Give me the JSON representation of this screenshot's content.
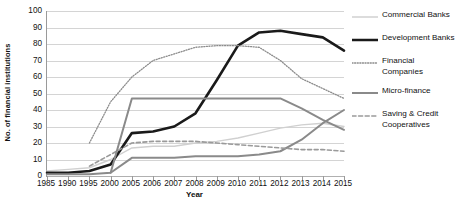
{
  "chart_data": {
    "type": "line",
    "title": "",
    "xlabel": "Year",
    "ylabel": "No. of financial institutions",
    "categories": [
      "1985",
      "1990",
      "1995",
      "2000",
      "2005",
      "2006",
      "2007",
      "2008",
      "2009",
      "2010",
      "2011",
      "2012",
      "2013",
      "2014",
      "2015"
    ],
    "ylim": [
      0,
      100
    ],
    "y_ticks": [
      0,
      10,
      20,
      30,
      40,
      50,
      60,
      70,
      80,
      90,
      100
    ],
    "grid": true,
    "legend_position": "right",
    "series": [
      {
        "name": "Commercial Banks",
        "style": "thin-light-solid",
        "color": "#d0d0d0",
        "values": [
          3,
          4,
          5,
          10,
          17,
          18,
          18,
          20,
          21,
          23,
          26,
          29,
          31,
          32,
          30
        ]
      },
      {
        "name": "Development Banks",
        "style": "thick-black-solid",
        "color": "#1a1a1a",
        "values": [
          2,
          2,
          3,
          7,
          26,
          27,
          30,
          38,
          58,
          79,
          87,
          88,
          86,
          84,
          76
        ]
      },
      {
        "name": "Financial Companies",
        "style": "dotted",
        "color": "#8c8c8c",
        "values": [
          null,
          null,
          20,
          45,
          60,
          70,
          74,
          78,
          79,
          79,
          78,
          70,
          59,
          53,
          47
        ]
      },
      {
        "name": "Micro-finance",
        "style": "medium-gray-solid",
        "color": "#8a8a8a",
        "values": [
          1,
          1,
          1,
          2,
          11,
          11,
          11,
          12,
          12,
          12,
          13,
          15,
          22,
          32,
          40
        ]
      },
      {
        "name": "Saving & Credit Cooperatives",
        "style": "dashed",
        "color": "#9a9a9a",
        "values": [
          null,
          null,
          6,
          13,
          20,
          21,
          21,
          21,
          20,
          19,
          18,
          17,
          16,
          16,
          15
        ]
      },
      {
        "name": "Micro-finance Flat",
        "style": "medium-gray-solid",
        "color": "#8a8a8a",
        "values": [
          null,
          null,
          null,
          2,
          47,
          47,
          47,
          47,
          47,
          47,
          47,
          47,
          41,
          34,
          28
        ]
      }
    ]
  }
}
